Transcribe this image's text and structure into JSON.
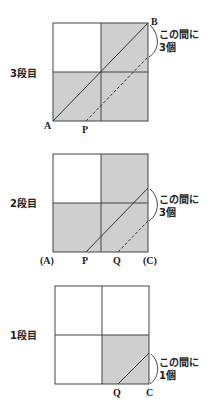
{
  "colors": {
    "shade": "#cfcfcf",
    "line": "#444444",
    "text": "#222222",
    "background": "#ffffff"
  },
  "panels": [
    {
      "id": "panel-3",
      "row_label": "3段目",
      "points": {
        "bottom_left": "A",
        "bottom_mid": "P",
        "top_right": "B"
      },
      "note_line1": "この間に",
      "note_line2": "3個"
    },
    {
      "id": "panel-2",
      "row_label": "2段目",
      "points": {
        "bottom_left": "(A)",
        "bottom_p": "P",
        "bottom_q": "Q",
        "bottom_right": "(C)"
      },
      "note_line1": "この間に",
      "note_line2": "3個"
    },
    {
      "id": "panel-1",
      "row_label": "1段目",
      "points": {
        "bottom_q": "Q",
        "bottom_right": "C"
      },
      "note_line1": "この間に",
      "note_line2": "1個"
    }
  ]
}
